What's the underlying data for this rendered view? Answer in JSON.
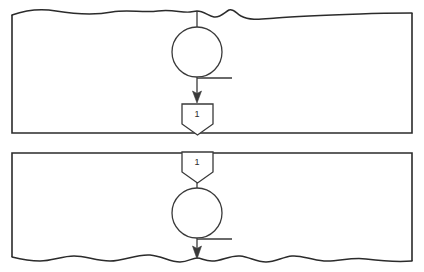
{
  "diagram": {
    "type": "flowchart-fragment",
    "background_color": "#ffffff",
    "line_color": "#2b2b2b",
    "shape_stroke_color": "#3a3a3a",
    "tick_color": "#6a6a6a",
    "panels": [
      {
        "name": "upper-page-fragment",
        "edge_style": "torn-top",
        "x": 12,
        "y": 10,
        "width": 400,
        "height": 123,
        "nodes": [
          {
            "name": "connector-circle-upper",
            "shape": "circle",
            "cx": 197,
            "cy": 52,
            "r": 25,
            "label": ""
          },
          {
            "name": "offpage-connector-out",
            "shape": "pentagon-down",
            "x": 182,
            "y": 103,
            "width": 31,
            "height": 30,
            "label": "1"
          }
        ],
        "connectors": [
          {
            "name": "flow-into-circle-upper",
            "from": "torn-top-edge",
            "to": "connector-circle-upper",
            "arrow": false
          },
          {
            "name": "flow-circle-to-offpage-out",
            "from": "connector-circle-upper",
            "to": "offpage-connector-out",
            "arrow": true
          }
        ]
      },
      {
        "name": "lower-page-fragment",
        "edge_style": "torn-bottom",
        "x": 12,
        "y": 152,
        "width": 400,
        "height": 110,
        "nodes": [
          {
            "name": "offpage-connector-in",
            "shape": "pentagon-down",
            "x": 182,
            "y": 152,
            "width": 31,
            "height": 30,
            "label": "1"
          },
          {
            "name": "connector-circle-lower",
            "shape": "circle",
            "cx": 197,
            "cy": 213,
            "r": 25,
            "label": ""
          }
        ],
        "connectors": [
          {
            "name": "flow-offpage-in-to-circle",
            "from": "offpage-connector-in",
            "to": "connector-circle-lower",
            "arrow": false
          },
          {
            "name": "flow-out-of-circle-lower",
            "from": "connector-circle-lower",
            "to": "torn-bottom-edge",
            "arrow": true
          }
        ]
      }
    ],
    "labels": {
      "offpage_out": "1",
      "offpage_in": "1"
    }
  }
}
